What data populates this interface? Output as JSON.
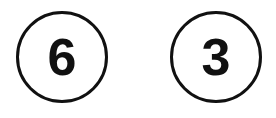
{
  "badges": [
    {
      "number": "6"
    },
    {
      "number": "3"
    }
  ],
  "colors": {
    "stroke": "#111111",
    "background": "#ffffff"
  }
}
